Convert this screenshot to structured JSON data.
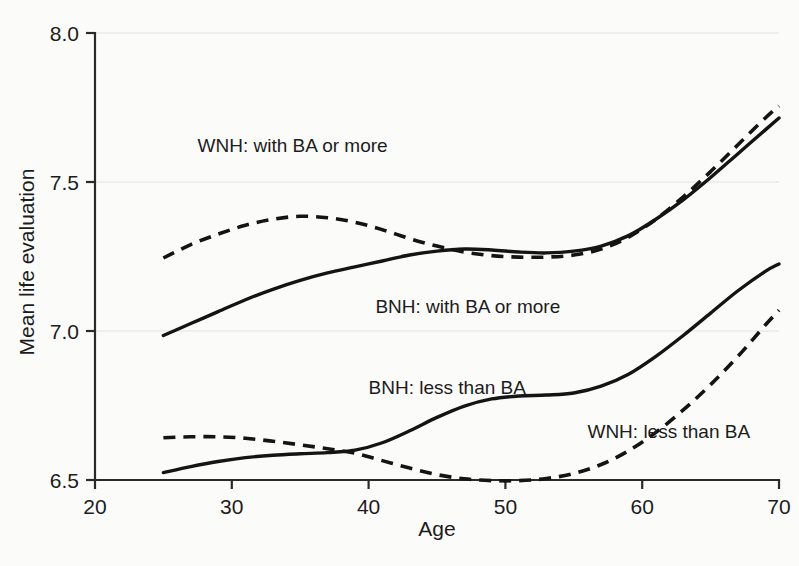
{
  "chart_data": {
    "type": "line",
    "title": "",
    "xlabel": "Age",
    "ylabel": "Mean life evaluation",
    "xlim": [
      20,
      70
    ],
    "ylim": [
      6.5,
      8.0
    ],
    "xticks": [
      "20",
      "30",
      "40",
      "50",
      "60",
      "70"
    ],
    "yticks": [
      "6.5",
      "7.0",
      "7.5",
      "8.0"
    ],
    "grid": true,
    "legend_position": "inline-annotations",
    "series": [
      {
        "name": "WNH: with BA or more",
        "style": "dashed",
        "x": [
          25,
          27,
          29,
          31,
          33,
          35,
          37,
          39,
          41,
          43,
          45,
          47,
          49,
          51,
          53,
          55,
          57,
          59,
          61,
          63,
          65,
          67,
          69,
          70
        ],
        "values": [
          7.245,
          7.29,
          7.325,
          7.355,
          7.375,
          7.385,
          7.38,
          7.365,
          7.34,
          7.31,
          7.285,
          7.265,
          7.253,
          7.248,
          7.248,
          7.255,
          7.275,
          7.315,
          7.375,
          7.45,
          7.535,
          7.625,
          7.715,
          7.755
        ]
      },
      {
        "name": "BNH: with BA or more",
        "style": "solid",
        "x": [
          25,
          27,
          29,
          31,
          33,
          35,
          37,
          39,
          41,
          43,
          45,
          47,
          49,
          51,
          53,
          55,
          57,
          59,
          61,
          63,
          65,
          67,
          69,
          70
        ],
        "values": [
          6.985,
          7.025,
          7.065,
          7.105,
          7.14,
          7.17,
          7.195,
          7.215,
          7.235,
          7.255,
          7.268,
          7.275,
          7.272,
          7.265,
          7.262,
          7.268,
          7.285,
          7.32,
          7.375,
          7.44,
          7.515,
          7.595,
          7.675,
          7.715
        ]
      },
      {
        "name": "BNH: less than BA",
        "style": "solid",
        "x": [
          25,
          27,
          29,
          31,
          33,
          35,
          37,
          39,
          41,
          43,
          45,
          47,
          49,
          51,
          53,
          55,
          57,
          59,
          61,
          63,
          65,
          67,
          69,
          70
        ],
        "values": [
          6.525,
          6.545,
          6.562,
          6.575,
          6.583,
          6.588,
          6.592,
          6.6,
          6.625,
          6.665,
          6.71,
          6.748,
          6.772,
          6.782,
          6.785,
          6.792,
          6.815,
          6.855,
          6.915,
          6.985,
          7.06,
          7.135,
          7.2,
          7.225
        ]
      },
      {
        "name": "WNH: less than BA",
        "style": "dashed",
        "x": [
          25,
          27,
          29,
          31,
          33,
          35,
          37,
          39,
          41,
          43,
          45,
          47,
          49,
          51,
          53,
          55,
          57,
          59,
          61,
          63,
          65,
          67,
          69,
          70
        ],
        "values": [
          6.642,
          6.645,
          6.645,
          6.64,
          6.63,
          6.618,
          6.605,
          6.59,
          6.565,
          6.54,
          6.518,
          6.504,
          6.498,
          6.498,
          6.505,
          6.522,
          6.552,
          6.598,
          6.66,
          6.735,
          6.82,
          6.915,
          7.02,
          7.07
        ]
      }
    ],
    "annotations": [
      {
        "text": "WNH: with BA or more",
        "x": 27.5,
        "y": 7.6
      },
      {
        "text": "BNH: with BA or more",
        "x": 40.5,
        "y": 7.06
      },
      {
        "text": "BNH: less than BA",
        "x": 40.0,
        "y": 6.79
      },
      {
        "text": "WNH: less than BA",
        "x": 56.0,
        "y": 6.64
      }
    ]
  }
}
